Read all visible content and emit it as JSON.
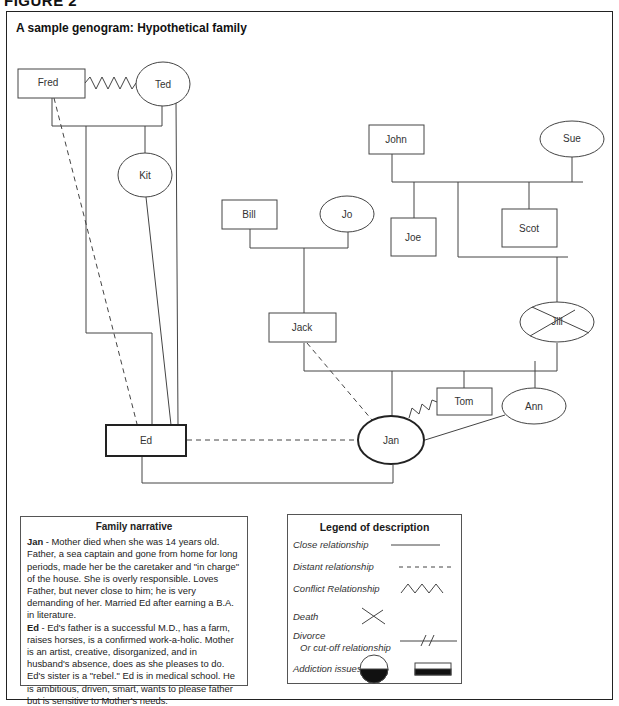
{
  "figure_label": "FIGURE 2",
  "title": "A sample genogram: Hypothetical family",
  "nodes": {
    "fred": {
      "label": "Fred",
      "shape": "square",
      "gender": "male"
    },
    "ted": {
      "label": "Ted",
      "shape": "circle",
      "gender": "female"
    },
    "kit": {
      "label": "Kit",
      "shape": "circle",
      "gender": "female"
    },
    "ed": {
      "label": "Ed",
      "shape": "square",
      "gender": "male",
      "emphasized": true
    },
    "bill": {
      "label": "Bill",
      "shape": "square",
      "gender": "male"
    },
    "jo": {
      "label": "Jo",
      "shape": "circle",
      "gender": "female"
    },
    "jack": {
      "label": "Jack",
      "shape": "square",
      "gender": "male"
    },
    "john": {
      "label": "John",
      "shape": "square",
      "gender": "male"
    },
    "sue": {
      "label": "Sue",
      "shape": "circle",
      "gender": "female"
    },
    "joe": {
      "label": "Joe",
      "shape": "square",
      "gender": "male"
    },
    "scot": {
      "label": "Scot",
      "shape": "square",
      "gender": "male"
    },
    "jill": {
      "label": "Jill",
      "shape": "circle",
      "gender": "female",
      "deceased": true
    },
    "tom": {
      "label": "Tom",
      "shape": "square",
      "gender": "male"
    },
    "ann": {
      "label": "Ann",
      "shape": "circle",
      "gender": "female"
    },
    "jan": {
      "label": "Jan",
      "shape": "circle",
      "gender": "female",
      "emphasized": true
    }
  },
  "relationships": [
    {
      "from": "Fred",
      "to": "Ted",
      "type": "conflict"
    },
    {
      "from": "Fred",
      "to": "Ed",
      "type": "distant"
    },
    {
      "from": "Ted",
      "to": "Ed",
      "type": "close"
    },
    {
      "from": "Kit",
      "to": "Ed",
      "type": "close"
    },
    {
      "from": "Jack",
      "to": "Jan",
      "type": "distant"
    },
    {
      "from": "Tom",
      "to": "Jan",
      "type": "conflict"
    },
    {
      "from": "Ann",
      "to": "Jan",
      "type": "close"
    },
    {
      "from": "Ed",
      "to": "Jan",
      "type": "distant"
    }
  ],
  "narrative": {
    "heading": "Family narrative",
    "entries": [
      {
        "name": "Jan",
        "text": " - Mother died when she was 14 years old. Father, a sea captain and gone from home for long periods, made her be the caretaker and \"in charge\" of the house. She is overly responsible. Loves Father, but never close to him; he is very demanding of her. Married Ed after earning a B.A. in literature."
      },
      {
        "name": "Ed",
        "text": " - Ed's father is a successful M.D., has a farm, raises horses, is a confirmed work-a-holic. Mother is an artist, creative, disorganized, and in husband's absence, does as she pleases to do. Ed's sister is a \"rebel.\" Ed is in medical school. He is ambitious, driven, smart, wants to please father but is sensitive to Mother's needs."
      }
    ]
  },
  "legend": {
    "heading": "Legend of description",
    "items": [
      {
        "label": "Close relationship",
        "symbol": "solid-line"
      },
      {
        "label": "Distant relationship",
        "symbol": "dashed-line"
      },
      {
        "label": "Conflict Relationship",
        "symbol": "zigzag-line"
      },
      {
        "label": "Death",
        "symbol": "x-mark"
      },
      {
        "label": "Divorce",
        "sublabel": "Or cut-off relationship",
        "symbol": "double-slash-line"
      },
      {
        "label": "Addiction issues",
        "symbol": "half-filled-circle-and-square"
      }
    ]
  }
}
